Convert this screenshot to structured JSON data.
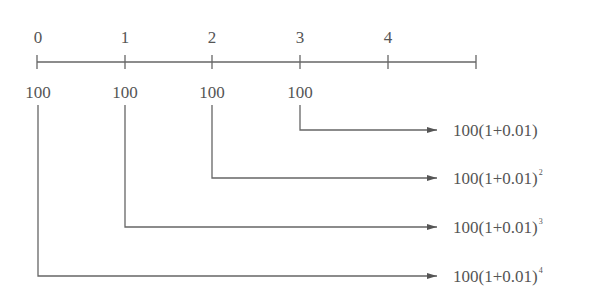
{
  "timeline": {
    "ticks": [
      "0",
      "1",
      "2",
      "3",
      "4"
    ],
    "deposits": [
      "100",
      "100",
      "100",
      "100"
    ]
  },
  "formulas": [
    {
      "base": "100(1+0.01)",
      "exponent": ""
    },
    {
      "base": "100(1+0.01)",
      "exponent": "2"
    },
    {
      "base": "100(1+0.01)",
      "exponent": "3"
    },
    {
      "base": "100(1+0.01)",
      "exponent": "4"
    }
  ],
  "colors": {
    "line": "#666666",
    "text": "#555555"
  }
}
